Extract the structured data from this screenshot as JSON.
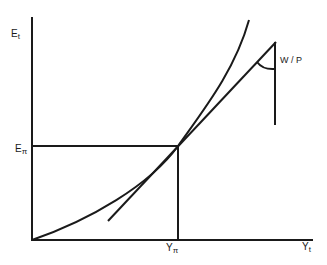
{
  "diagram": {
    "y_axis_label": {
      "main": "E",
      "sub": "t"
    },
    "x_axis_label": {
      "main": "Y",
      "sub": "t"
    },
    "y_marker_label": {
      "main": "E",
      "sub": "π"
    },
    "x_marker_label": {
      "main": "Y",
      "sub": "π"
    },
    "angle_label": "W / P",
    "elements": [
      "convex curve from origin",
      "tangent line at (Yπ, Eπ)",
      "horizontal guide at Eπ",
      "vertical guide at Yπ",
      "vertical reference line",
      "angle arc W/P"
    ]
  }
}
